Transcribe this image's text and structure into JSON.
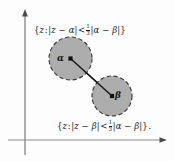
{
  "figure": {
    "background_color": "#fdfdfd",
    "axes": {
      "color": "#8c8c8c",
      "x_axis": {
        "name": "real-axis",
        "y": 140,
        "x_start": 8,
        "x_end": 166,
        "arrow": "right"
      },
      "y_axis": {
        "name": "imaginary-axis",
        "x": 25,
        "y_start": 10,
        "y_end": 155,
        "arrow": "up"
      }
    },
    "disks": [
      {
        "id": "alpha-disk",
        "center_label": "α",
        "cx": 70.5,
        "cy": 58.5,
        "r": 21.5,
        "fill": "#a9a9a9",
        "stroke": "#3a3a3a",
        "dashed": true
      },
      {
        "id": "beta-disk",
        "center_label": "β",
        "cx": 112,
        "cy": 96,
        "r": 20,
        "fill": "#a9a9a9",
        "stroke": "#3a3a3a",
        "dashed": true
      }
    ],
    "connector": {
      "name": "alpha-beta-segment",
      "x1": 70.5,
      "y1": 58.5,
      "x2": 112,
      "y2": 96,
      "color": "#1a1a1a"
    },
    "labels": {
      "top_set": {
        "text": "{z : |z − α| < ⅓|α − β|}",
        "open_brace": "{",
        "var": "z",
        "colon": ":",
        "modulus_left": "|z − α|",
        "relation": "<",
        "frac_num": "1",
        "frac_den": "3",
        "modulus_right": "|α − β|",
        "close_brace": "}",
        "trailing": ""
      },
      "bottom_set": {
        "text": "{z : |z − β| < ⅓|α − β|} .",
        "open_brace": "{",
        "var": "z",
        "colon": ":",
        "modulus_left": "|z − β|",
        "relation": "<",
        "frac_num": "1",
        "frac_den": "3",
        "modulus_right": "|α − β|",
        "close_brace": "}",
        "trailing": "."
      }
    }
  }
}
